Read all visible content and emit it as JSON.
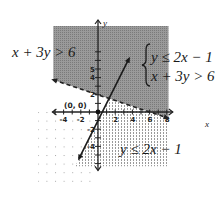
{
  "chart_data": {
    "type": "inequality-graph",
    "title": "",
    "system": [
      "y ≤ 2x − 1",
      "x + 3y > 6"
    ],
    "xlabel": "x",
    "ylabel": "y",
    "xlim": [
      -5,
      9
    ],
    "ylim": [
      -6,
      7
    ],
    "x_tick_labels": [
      "-4",
      "-2",
      "2",
      "4",
      "6",
      "8"
    ],
    "y_tick_labels": [
      "5",
      "4",
      "2",
      "-2",
      "-4"
    ],
    "grid": "dotted",
    "boundaries": [
      {
        "name": "y = 2x − 1",
        "style": "solid",
        "slope": 2,
        "intercept": -1,
        "shade": "below-right (dotted region)"
      },
      {
        "name": "x + 3y = 6",
        "style": "dashed",
        "slope": -0.3333,
        "intercept": 2,
        "shade": "above (dark region)"
      }
    ],
    "annotations": [
      {
        "text": "x + 3y > 6",
        "position": "upper-left"
      },
      {
        "text": "y ≤ 2x − 1",
        "position": "lower-right"
      },
      {
        "text": "(0, 0)",
        "position": "origin test point"
      }
    ],
    "colors": {
      "dark_region": "#8f8f8f",
      "dotted_region": "#bdbdbd",
      "axis": "#222222"
    }
  },
  "labels": {
    "ineq_left": "x + 3y > 6",
    "ineq_bottom": "y ≤ 2x − 1",
    "system_line1": "y ≤ 2x − 1",
    "system_line2": "x + 3y > 6",
    "origin": "(0, 0)",
    "x_axis": "x",
    "y_axis": "y"
  },
  "ticks": {
    "x": [
      {
        "value": -4,
        "label": "-4"
      },
      {
        "value": -2,
        "label": "-2"
      },
      {
        "value": 2,
        "label": "2"
      },
      {
        "value": 4,
        "label": "4"
      },
      {
        "value": 6,
        "label": "6"
      },
      {
        "value": 8,
        "label": "8"
      }
    ],
    "y": [
      {
        "value": 5,
        "label": "5"
      },
      {
        "value": 4,
        "label": "4"
      },
      {
        "value": 2,
        "label": "2"
      },
      {
        "value": -2,
        "label": "-2"
      },
      {
        "value": -4,
        "label": "-4"
      }
    ]
  }
}
